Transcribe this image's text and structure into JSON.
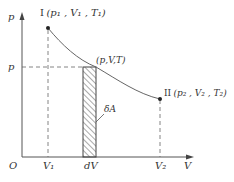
{
  "diagram": {
    "axes": {
      "y_label": "p",
      "x_label": "V",
      "origin_label": "O"
    },
    "states": [
      {
        "id": "I",
        "label_prefix": "I",
        "label_body": "(p₁ , V₁ , T₁)"
      },
      {
        "id": "II",
        "label_prefix": "II",
        "label_body": "(p₂ , V₂ , T₂)"
      }
    ],
    "intermediate_point": {
      "label": "(p,V,T)"
    },
    "y_ticks": [
      {
        "label": "p"
      }
    ],
    "x_ticks": [
      {
        "label": "V₁"
      },
      {
        "label": "dV"
      },
      {
        "label": "V₂"
      }
    ],
    "strip_label": "δA",
    "colors": {
      "line": "#555555",
      "curve": "#666666",
      "text": "#333333"
    }
  }
}
